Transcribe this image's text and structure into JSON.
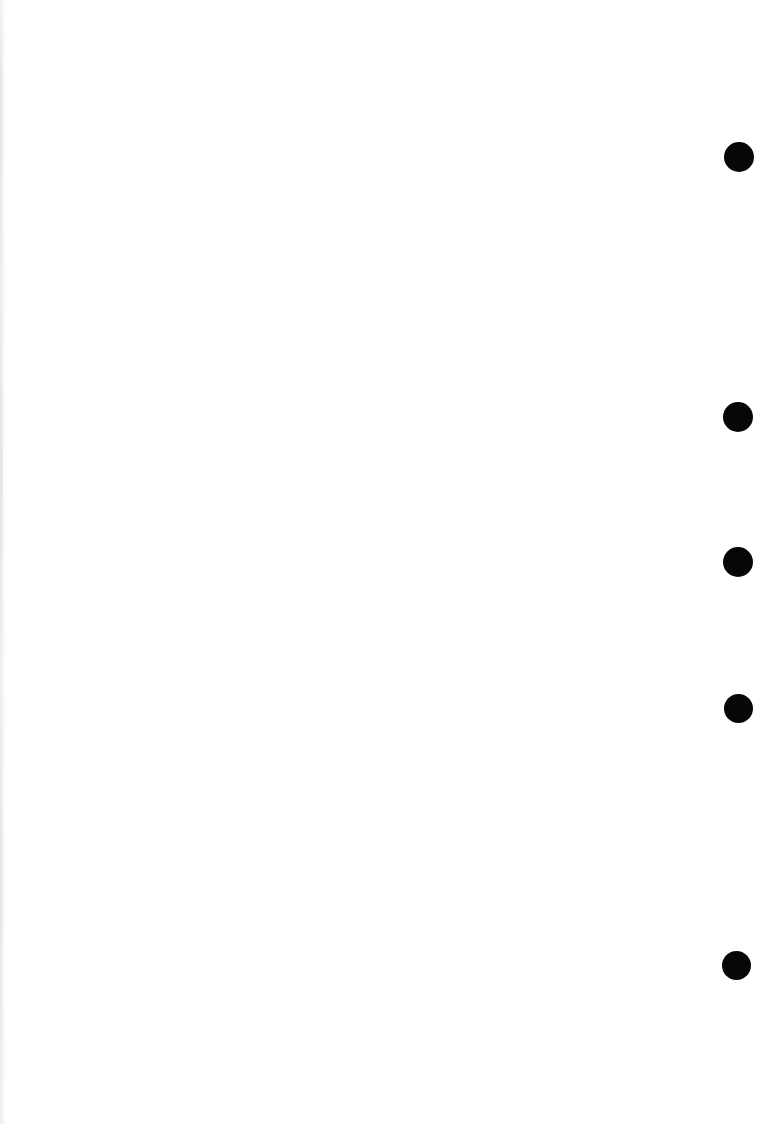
{
  "page": {
    "width": 772,
    "height": 1124,
    "background_color": "#ffffff",
    "ink_color": "#070707",
    "visible_text": "",
    "body_text": "",
    "description_label": ""
  },
  "margin_bullets": {
    "count": 5,
    "shape": "filled-circle",
    "color": "#070707",
    "column_label": "",
    "items": [
      {
        "index": "1",
        "cx": 739,
        "cy": 157,
        "diameter": 30,
        "label": ""
      },
      {
        "index": "2",
        "cx": 738,
        "cy": 417,
        "diameter": 30,
        "label": ""
      },
      {
        "index": "3",
        "cx": 738,
        "cy": 562,
        "diameter": 30,
        "label": ""
      },
      {
        "index": "4",
        "cx": 738,
        "cy": 708,
        "diameter": 29,
        "label": ""
      },
      {
        "index": "5",
        "cx": 736,
        "cy": 965,
        "diameter": 29,
        "label": ""
      }
    ]
  },
  "artifacts": {
    "left_edge_shadow": true
  }
}
